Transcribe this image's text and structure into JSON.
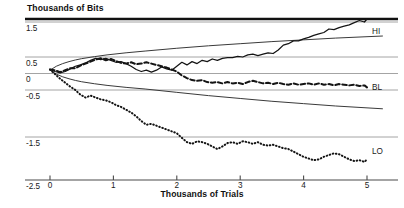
{
  "chart_data": {
    "type": "line",
    "title": "",
    "ylabel": "Thousands of Bits",
    "xlabel": "Thousands of Trials",
    "xlim": [
      0,
      5.25
    ],
    "ylim": [
      -2.5,
      1.9
    ],
    "grid": true,
    "legend_position": "right-inline",
    "y_ticks": [
      1.5,
      0.5,
      0,
      -0.5,
      -1.5,
      -2.5
    ],
    "y_tick_labels": [
      "1.5",
      "0.5",
      "0",
      "-0.5",
      "-1.5",
      "-2.5"
    ],
    "x_ticks": [
      0,
      1,
      2,
      3,
      4,
      5
    ],
    "x_tick_labels": [
      "0",
      "1",
      "2",
      "3",
      "4",
      "5"
    ],
    "series": [
      {
        "name": "HI",
        "label": "HI",
        "style": "solid",
        "color": "#141414",
        "x": [
          0,
          0.08,
          0.16,
          0.24,
          0.32,
          0.4,
          0.48,
          0.56,
          0.64,
          0.72,
          0.8,
          0.88,
          0.96,
          1.04,
          1.12,
          1.2,
          1.28,
          1.36,
          1.44,
          1.52,
          1.6,
          1.68,
          1.76,
          1.84,
          1.92,
          2.0,
          2.08,
          2.16,
          2.24,
          2.32,
          2.4,
          2.48,
          2.56,
          2.64,
          2.72,
          2.8,
          2.88,
          2.96,
          3.04,
          3.12,
          3.2,
          3.28,
          3.36,
          3.44,
          3.52,
          3.6,
          3.68,
          3.76,
          3.84,
          3.92,
          4.0,
          4.08,
          4.16,
          4.24,
          4.32,
          4.4,
          4.48,
          4.56,
          4.64,
          4.72,
          4.8,
          4.88,
          4.96,
          5.0
        ],
        "y": [
          0.12,
          0.06,
          0.02,
          0.06,
          0.14,
          0.22,
          0.26,
          0.32,
          0.4,
          0.46,
          0.42,
          0.46,
          0.4,
          0.34,
          0.36,
          0.3,
          0.22,
          0.12,
          0.06,
          0.1,
          0.04,
          0.1,
          0.2,
          0.14,
          0.1,
          0.22,
          0.34,
          0.26,
          0.36,
          0.3,
          0.4,
          0.36,
          0.44,
          0.4,
          0.46,
          0.48,
          0.48,
          0.52,
          0.5,
          0.56,
          0.58,
          0.54,
          0.58,
          0.62,
          0.6,
          0.7,
          0.84,
          0.88,
          0.96,
          0.96,
          1.02,
          1.06,
          1.12,
          1.16,
          1.2,
          1.3,
          1.28,
          1.34,
          1.38,
          1.42,
          1.48,
          1.56,
          1.5,
          1.62
        ]
      },
      {
        "name": "BL",
        "label": "BL",
        "style": "dashed",
        "color": "#141414",
        "x": [
          0,
          0.08,
          0.16,
          0.24,
          0.32,
          0.4,
          0.48,
          0.56,
          0.64,
          0.72,
          0.8,
          0.88,
          0.96,
          1.04,
          1.12,
          1.2,
          1.28,
          1.36,
          1.44,
          1.52,
          1.6,
          1.68,
          1.76,
          1.84,
          1.92,
          2.0,
          2.08,
          2.16,
          2.24,
          2.32,
          2.4,
          2.48,
          2.56,
          2.64,
          2.72,
          2.8,
          2.88,
          2.96,
          3.04,
          3.12,
          3.2,
          3.28,
          3.36,
          3.44,
          3.52,
          3.6,
          3.68,
          3.76,
          3.84,
          3.92,
          4.0,
          4.08,
          4.16,
          4.24,
          4.32,
          4.4,
          4.48,
          4.56,
          4.64,
          4.72,
          4.8,
          4.88,
          4.96,
          5.0
        ],
        "y": [
          0.12,
          0.1,
          0.04,
          0.1,
          0.16,
          0.16,
          0.24,
          0.3,
          0.36,
          0.42,
          0.46,
          0.4,
          0.44,
          0.38,
          0.32,
          0.3,
          0.34,
          0.28,
          0.3,
          0.34,
          0.3,
          0.26,
          0.22,
          0.18,
          0.12,
          0.06,
          -0.06,
          -0.14,
          -0.2,
          -0.22,
          -0.2,
          -0.26,
          -0.28,
          -0.26,
          -0.3,
          -0.26,
          -0.3,
          -0.28,
          -0.32,
          -0.26,
          -0.22,
          -0.26,
          -0.3,
          -0.28,
          -0.32,
          -0.28,
          -0.32,
          -0.34,
          -0.3,
          -0.34,
          -0.32,
          -0.3,
          -0.34,
          -0.3,
          -0.34,
          -0.32,
          -0.36,
          -0.32,
          -0.34,
          -0.36,
          -0.34,
          -0.38,
          -0.36,
          -0.42
        ]
      },
      {
        "name": "LO",
        "label": "LO",
        "style": "dotted",
        "color": "#141414",
        "x": [
          0,
          0.08,
          0.16,
          0.24,
          0.32,
          0.4,
          0.48,
          0.56,
          0.64,
          0.72,
          0.8,
          0.88,
          0.96,
          1.04,
          1.12,
          1.2,
          1.28,
          1.36,
          1.44,
          1.52,
          1.6,
          1.68,
          1.76,
          1.84,
          1.92,
          2.0,
          2.08,
          2.16,
          2.24,
          2.32,
          2.4,
          2.48,
          2.56,
          2.64,
          2.72,
          2.8,
          2.88,
          2.96,
          3.04,
          3.12,
          3.2,
          3.28,
          3.36,
          3.44,
          3.52,
          3.6,
          3.68,
          3.76,
          3.84,
          3.92,
          4.0,
          4.08,
          4.16,
          4.24,
          4.32,
          4.4,
          4.48,
          4.56,
          4.64,
          4.72,
          4.8,
          4.88,
          4.96,
          5.0
        ],
        "y": [
          0.12,
          -0.02,
          -0.16,
          -0.28,
          -0.4,
          -0.5,
          -0.6,
          -0.66,
          -0.62,
          -0.66,
          -0.7,
          -0.72,
          -0.76,
          -0.82,
          -0.86,
          -0.92,
          -0.98,
          -1.06,
          -1.16,
          -1.24,
          -1.22,
          -1.26,
          -1.3,
          -1.34,
          -1.38,
          -1.42,
          -1.52,
          -1.62,
          -1.66,
          -1.6,
          -1.62,
          -1.66,
          -1.72,
          -1.78,
          -1.72,
          -1.64,
          -1.62,
          -1.66,
          -1.6,
          -1.62,
          -1.66,
          -1.62,
          -1.68,
          -1.7,
          -1.68,
          -1.72,
          -1.76,
          -1.78,
          -1.84,
          -1.9,
          -1.96,
          -2.0,
          -2.04,
          -2.02,
          -1.96,
          -1.92,
          -1.88,
          -1.9,
          -1.96,
          -2.02,
          -2.06,
          -2.04,
          -2.08,
          -2.02
        ]
      }
    ],
    "envelopes": [
      {
        "name": "upper-envelope",
        "style": "solid-thin",
        "color": "#3a3a3a",
        "x": [
          0,
          0.1,
          0.2,
          0.3,
          0.4,
          0.5,
          0.7,
          0.9,
          1.2,
          1.5,
          2.0,
          2.5,
          3.0,
          3.5,
          4.0,
          4.5,
          5.0,
          5.25
        ],
        "y": [
          0.1,
          0.22,
          0.3,
          0.36,
          0.41,
          0.45,
          0.51,
          0.56,
          0.62,
          0.67,
          0.75,
          0.82,
          0.88,
          0.94,
          0.99,
          1.04,
          1.08,
          1.1
        ]
      },
      {
        "name": "lower-envelope",
        "style": "solid-thin",
        "color": "#3a3a3a",
        "x": [
          0,
          0.1,
          0.2,
          0.3,
          0.4,
          0.5,
          0.7,
          0.9,
          1.2,
          1.5,
          2.0,
          2.5,
          3.0,
          3.5,
          4.0,
          4.5,
          5.0,
          5.25
        ],
        "y": [
          0.1,
          -0.02,
          -0.1,
          -0.16,
          -0.21,
          -0.25,
          -0.31,
          -0.36,
          -0.42,
          -0.47,
          -0.55,
          -0.62,
          -0.68,
          -0.74,
          -0.79,
          -0.84,
          -0.88,
          -0.9
        ]
      }
    ]
  }
}
